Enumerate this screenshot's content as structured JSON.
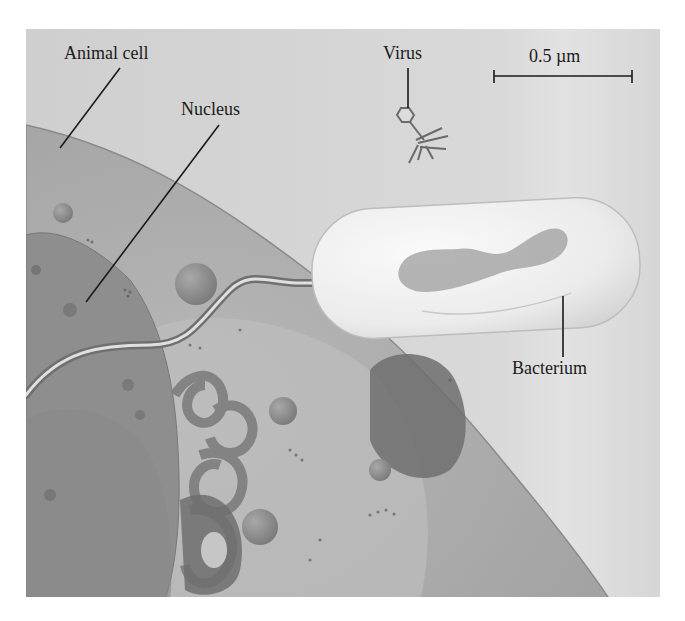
{
  "figure": {
    "labels": {
      "animal_cell": "Animal cell",
      "nucleus": "Nucleus",
      "virus": "Virus",
      "bacterium": "Bacterium"
    },
    "scale_bar": {
      "label": "0.5 µm",
      "value": 0.5,
      "unit": "µm"
    },
    "colors": {
      "background_panel": "#d2d2d2",
      "cell_cytoplasm": "#a9a9a9",
      "nucleus": "#8c8c8c",
      "bacterium": "#ececec",
      "bacterium_nucleoid": "#a0a0a0",
      "label_text": "#1a1a1a",
      "leader_line": "#1a1a1a"
    }
  }
}
